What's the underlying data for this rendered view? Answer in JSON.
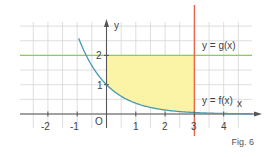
{
  "figure": {
    "caption": "Fig. 6",
    "colors": {
      "grid": "#d6d6d6",
      "axis": "#555555",
      "curve_f": "#4a9ab0",
      "line_g": "#8ccf4a",
      "line_x3": "#e8674a",
      "fill": "#fbf3a6",
      "label_f": "#5aa8c0",
      "label_g": "#7cbf3a"
    },
    "axes": {
      "x_label": "x",
      "y_label": "y",
      "origin_label": "O",
      "x_ticks": [
        "-2",
        "-1",
        "1",
        "2",
        "3",
        "4"
      ],
      "y_ticks": [
        "1",
        "2"
      ]
    },
    "labels": {
      "g": "y = g(x)",
      "f": "y = f(x)"
    }
  },
  "chart_data": {
    "type": "line",
    "title": "",
    "xlabel": "x",
    "ylabel": "y",
    "xlim": [
      -2.9,
      5
    ],
    "ylim": [
      -0.5,
      3.1
    ],
    "grid": true,
    "series": [
      {
        "name": "y = f(x)",
        "kind": "exponential decay",
        "points": [
          [
            -0.9,
            3.1
          ],
          [
            -0.5,
            1.8
          ],
          [
            0,
            1
          ],
          [
            1,
            0.37
          ],
          [
            2,
            0.14
          ],
          [
            3,
            0.05
          ],
          [
            4,
            0.02
          ],
          [
            5,
            0.01
          ]
        ]
      },
      {
        "name": "y = g(x)",
        "kind": "constant",
        "value": 2
      },
      {
        "name": "x = 3",
        "kind": "vertical line",
        "value": 3
      }
    ],
    "shaded_region": {
      "description": "between f(x) and g(x) for 0 <= x <= 3",
      "x_range": [
        0,
        3
      ],
      "upper": "g(x) = 2",
      "lower": "f(x)"
    },
    "annotations": [
      "y = g(x)",
      "y = f(x)",
      "O",
      "Fig. 6"
    ]
  }
}
